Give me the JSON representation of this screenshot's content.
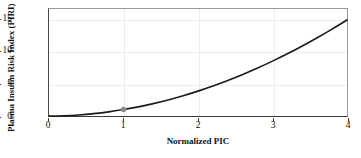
{
  "chart_data": {
    "type": "line",
    "title": "",
    "xlabel": "Normalized PIC",
    "ylabel": "Plasma Insulin Risk Index (PIRI)",
    "xlim": [
      0,
      4
    ],
    "ylim": [
      0,
      16.6
    ],
    "grid": true,
    "legend": null,
    "x_ticks": [
      0,
      1,
      2,
      3,
      4
    ],
    "x_tick_labels": [
      "0",
      "1",
      "2",
      "3",
      "4"
    ],
    "y_ticks": [
      0,
      5,
      10,
      15
    ],
    "y_tick_labels": [
      "0",
      "5",
      "10",
      "15"
    ],
    "line_color": "#1a1a1a",
    "line_width": 1.6,
    "marker_color": "#8c8c8c",
    "series": [
      {
        "name": "PIRI vs Normalized PIC",
        "relation": "y = x^1.95",
        "x": [
          0,
          0.2,
          0.4,
          0.6,
          0.8,
          1.0,
          1.2,
          1.4,
          1.6,
          1.8,
          2.0,
          2.2,
          2.4,
          2.6,
          2.8,
          3.0,
          3.2,
          3.4,
          3.6,
          3.8,
          4.0
        ],
        "values": [
          0,
          0.043,
          0.166,
          0.365,
          0.637,
          1.0,
          1.42,
          1.92,
          2.49,
          3.14,
          3.86,
          4.65,
          5.51,
          6.44,
          7.44,
          8.51,
          9.65,
          10.86,
          12.14,
          13.48,
          14.9
        ]
      }
    ],
    "annotations": [
      {
        "name": "reference-point",
        "x": 1,
        "y": 1,
        "marker": "circle",
        "color": "#8c8c8c",
        "label": ""
      }
    ]
  }
}
